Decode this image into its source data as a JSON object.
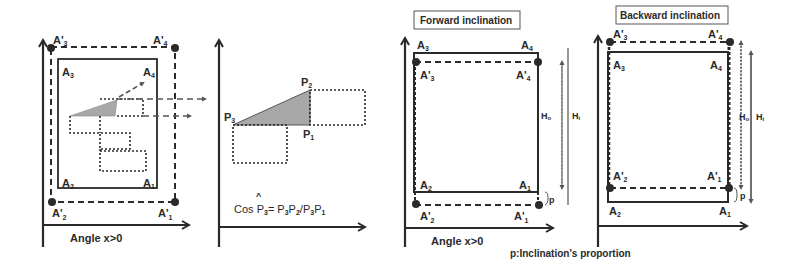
{
  "colors": {
    "stroke": "#2a2a2a",
    "fill_triangle": "#a8a8a8",
    "background": "#ffffff"
  },
  "panel1": {
    "corners_outer": {
      "top_left": "A'",
      "top_left_sub": "3",
      "top_right": "A'",
      "top_right_sub": "4",
      "bottom_left": "A'",
      "bottom_left_sub": "2",
      "bottom_right": "A'",
      "bottom_right_sub": "1"
    },
    "corners_inner": {
      "top_left": "A",
      "top_left_sub": "3",
      "top_right": "A",
      "top_right_sub": "4",
      "bottom_left": "A",
      "bottom_left_sub": "2",
      "bottom_right": "A",
      "bottom_right_sub": "1"
    },
    "axis_label": "Angle x>0"
  },
  "panel2": {
    "points": {
      "p1": "P",
      "p1_sub": "1",
      "p2": "P",
      "p2_sub": "2",
      "p3": "P",
      "p3_sub": "3"
    },
    "formula": {
      "prefix": "Cos ",
      "hat": "^",
      "var": "P",
      "var_sub": "3",
      "eq": "= P",
      "a_sub": "3",
      "b": "P",
      "b_sub": "2",
      "slash": "/P",
      "c_sub": "3",
      "d": "P",
      "d_sub": "1"
    }
  },
  "panel3": {
    "title": "Forward inclination",
    "corners_inner": {
      "top_left": "A",
      "top_left_sub": "3",
      "top_right": "A",
      "top_right_sub": "4",
      "bottom_left": "A",
      "bottom_left_sub": "2",
      "bottom_right": "A",
      "bottom_right_sub": "1"
    },
    "corners_outer": {
      "top_left": "A'",
      "top_left_sub": "3",
      "top_right": "A'",
      "top_right_sub": "4",
      "bottom_left": "A'",
      "bottom_left_sub": "2",
      "bottom_right": "A'",
      "bottom_right_sub": "1"
    },
    "h0_label": "H",
    "h0_sub": "o",
    "h1_label": "H",
    "h1_sub": "i",
    "p_label": "p",
    "axis_label": "Angle x>0"
  },
  "panel4": {
    "title": "Backward inclination",
    "corners_outer": {
      "top_left": "A'",
      "top_left_sub": "3",
      "top_right": "A'",
      "top_right_sub": "4",
      "bottom_left": "A'",
      "bottom_left_sub": "2",
      "bottom_right": "A'",
      "bottom_right_sub": "1"
    },
    "corners_inner": {
      "top_left": "A",
      "top_left_sub": "3",
      "top_right": "A",
      "top_right_sub": "4",
      "bottom_left": "A",
      "bottom_left_sub": "2",
      "bottom_right": "A",
      "bottom_right_sub": "1"
    },
    "h0_label": "H",
    "h0_sub": "o",
    "h1_label": "H",
    "h1_sub": "i",
    "p_label": "p"
  },
  "caption": "p:Inclination's proportion"
}
